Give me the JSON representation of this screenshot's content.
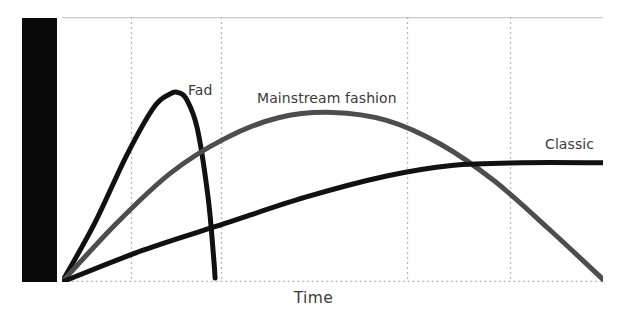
{
  "chart_data": {
    "type": "line",
    "title": "",
    "xlabel": "Time",
    "ylabel": "Consumer Acceptance",
    "grid": "vertical-dotted",
    "legend_position": "inline-labels",
    "xlim": [
      0,
      100
    ],
    "ylim": [
      0,
      100
    ],
    "axis_ticks": {
      "x_gridlines": [
        12.8,
        29.4,
        63.8,
        82.8
      ],
      "y_gridlines": []
    },
    "series": [
      {
        "name": "Fad",
        "color": "#111111",
        "label_x": 188,
        "label_y": 82,
        "points": [
          {
            "x": 0,
            "y": 0
          },
          {
            "x": 6,
            "y": 22
          },
          {
            "x": 12,
            "y": 48
          },
          {
            "x": 17,
            "y": 66
          },
          {
            "x": 20,
            "y": 71
          },
          {
            "x": 21.5,
            "y": 71.5
          },
          {
            "x": 23,
            "y": 69
          },
          {
            "x": 25,
            "y": 58
          },
          {
            "x": 27,
            "y": 32
          },
          {
            "x": 28,
            "y": 10
          },
          {
            "x": 28.3,
            "y": 1.5
          }
        ]
      },
      {
        "name": "Mainstream fashion",
        "color": "#4d4d4d",
        "label_x": 257,
        "label_y": 90,
        "points": [
          {
            "x": 0,
            "y": 0
          },
          {
            "x": 10,
            "y": 22
          },
          {
            "x": 20,
            "y": 41
          },
          {
            "x": 30,
            "y": 54
          },
          {
            "x": 40,
            "y": 62
          },
          {
            "x": 50,
            "y": 64
          },
          {
            "x": 60,
            "y": 61
          },
          {
            "x": 70,
            "y": 52
          },
          {
            "x": 80,
            "y": 38
          },
          {
            "x": 90,
            "y": 20
          },
          {
            "x": 100,
            "y": 1
          }
        ]
      },
      {
        "name": "Classic",
        "color": "#111111",
        "label_x": 545,
        "label_y": 136,
        "points": [
          {
            "x": 0,
            "y": 0
          },
          {
            "x": 15,
            "y": 12
          },
          {
            "x": 30,
            "y": 22
          },
          {
            "x": 45,
            "y": 32
          },
          {
            "x": 60,
            "y": 40
          },
          {
            "x": 72,
            "y": 44
          },
          {
            "x": 85,
            "y": 45
          },
          {
            "x": 100,
            "y": 45
          }
        ]
      }
    ]
  },
  "axis": {
    "y_label": "Consumer Acceptance",
    "x_label": "Time"
  },
  "labels": {
    "fad": "Fad",
    "mainstream": "Mainstream fashion",
    "classic": "Classic"
  },
  "colors": {
    "fad": "#111111",
    "mainstream": "#4d4d4d",
    "classic": "#111111",
    "axis_band": "#0a0a0a",
    "gridline": "#b8b8b8",
    "border": "#c9c9c9",
    "background": "#ffffff",
    "text": "#3a3a3a",
    "axis_text": "#ffffff"
  }
}
